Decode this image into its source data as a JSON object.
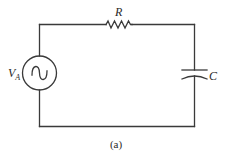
{
  "diagram": {
    "type": "circuit-schematic",
    "caption": "(a)",
    "components": {
      "source": {
        "kind": "ac-voltage-source",
        "label_main": "V",
        "label_sub": "A"
      },
      "resistor": {
        "kind": "resistor",
        "label": "R"
      },
      "capacitor": {
        "kind": "capacitor",
        "label": "C"
      }
    },
    "connections": [
      [
        "source",
        "resistor"
      ],
      [
        "resistor",
        "capacitor"
      ],
      [
        "capacitor",
        "source"
      ]
    ],
    "colors": {
      "line": "#3a3a3a",
      "text": "#2a2a2a",
      "background": "#ffffff"
    }
  }
}
